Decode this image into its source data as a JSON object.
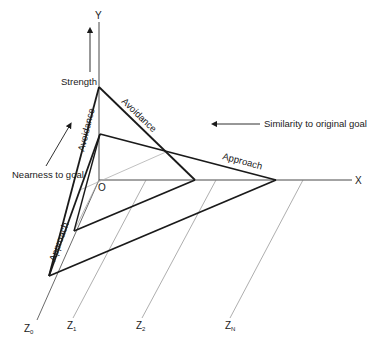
{
  "diagram": {
    "axes": {
      "y_label": "Y",
      "x_label": "X",
      "origin_label": "O",
      "z_labels": [
        {
          "main": "Z",
          "sub": "0"
        },
        {
          "main": "Z",
          "sub": "1"
        },
        {
          "main": "Z",
          "sub": "2"
        },
        {
          "main": "Z",
          "sub": "N"
        }
      ]
    },
    "annotations": {
      "strength": "Strength",
      "nearness": "Nearness to goal",
      "similarity": "Similarity to original goal"
    },
    "gradient_labels": {
      "avoidance_vertical": "Avoidance",
      "avoidance_diagonal": "Avoidance",
      "approach_horizontal": "Approach",
      "approach_diagonal": "Approach"
    },
    "colors": {
      "line": "#1a1a1a",
      "thin": "#555555",
      "gray": "#b0b0b0"
    }
  }
}
